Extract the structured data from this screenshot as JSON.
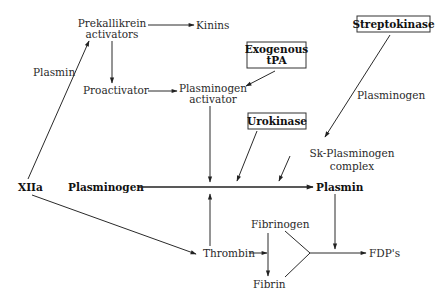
{
  "diagram": {
    "type": "fibrinolysis-pathway",
    "nodes": {
      "prekallikrein_activators": [
        "Prekallikrein",
        "activators"
      ],
      "kinins": "Kinins",
      "proactivator": "Proactivator",
      "plasminogen_activator": [
        "Plasminogen",
        "activator"
      ],
      "exogenous_tpa": [
        "Exogenous",
        "tPA"
      ],
      "streptokinase": "Streptokinase",
      "urokinase": "Urokinase",
      "sk_plasminogen_complex": [
        "Sk-Plasminogen",
        "complex"
      ],
      "xiia": "XIIa",
      "plasminogen": "Plasminogen",
      "plasmin": "Plasmin",
      "thrombin": "Thrombin",
      "fibrinogen": "Fibrinogen",
      "fibrin": "Fibrin",
      "fdps": "FDP's"
    },
    "edge_labels": {
      "xiia_to_prekallikrein": "Plasmin",
      "streptokinase_to_complex": "Plasminogen"
    },
    "edges": [
      {
        "from": "Prekallikrein activators",
        "to": "Kinins"
      },
      {
        "from": "Prekallikrein activators",
        "to": "Proactivator"
      },
      {
        "from": "Proactivator",
        "to": "Plasminogen activator"
      },
      {
        "from": "Exogenous tPA",
        "to": "Plasminogen activator"
      },
      {
        "from": "Streptokinase",
        "to": "Sk-Plasminogen complex",
        "label": "Plasminogen"
      },
      {
        "from": "XIIa",
        "to": "Prekallikrein activators",
        "label": "Plasmin"
      },
      {
        "from": "XIIa",
        "to": "Thrombin"
      },
      {
        "from": "Plasminogen",
        "to": "Plasmin"
      },
      {
        "from": "Plasminogen activator",
        "to": "Plasminogen->Plasmin"
      },
      {
        "from": "Urokinase",
        "to": "Plasminogen->Plasmin"
      },
      {
        "from": "Sk-Plasminogen complex",
        "to": "Plasminogen->Plasmin"
      },
      {
        "from": "Thrombin",
        "to": "Plasminogen->Plasmin"
      },
      {
        "from": "Thrombin",
        "to": "Fibrinogen->Fibrin"
      },
      {
        "from": "Fibrinogen",
        "to": "Fibrin"
      },
      {
        "from": "Fibrinogen",
        "to": "FDP's"
      },
      {
        "from": "Fibrin",
        "to": "FDP's"
      },
      {
        "from": "Plasmin",
        "to": "FDP's"
      }
    ],
    "colors": {
      "line": "#2a2a2a",
      "text": "#2a2a2a",
      "background": "#ffffff"
    }
  }
}
